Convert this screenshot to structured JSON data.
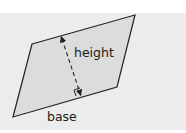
{
  "diagram": {
    "shape": "parallelogram",
    "labels": {
      "height": "height",
      "base": "base"
    },
    "colors": {
      "background": "#ececec",
      "shape_fill": "#dcdcdc",
      "stroke": "#222222"
    },
    "vertices": [
      [
        32,
        44
      ],
      [
        135,
        15
      ],
      [
        117,
        87
      ],
      [
        13,
        117
      ]
    ],
    "height_line": {
      "from": [
        62,
        38
      ],
      "to": [
        81,
        96
      ],
      "style": "dashed",
      "arrowheads": "both"
    },
    "right_angle_marker": true
  }
}
